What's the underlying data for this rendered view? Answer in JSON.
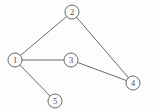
{
  "diagram": {
    "type": "node-link-graph",
    "canvas": {
      "width": 153,
      "height": 112,
      "background": "#fdfdfc"
    },
    "style": {
      "stroke_color": "#5a5a5a",
      "node_fill": "#fdfdfc",
      "label_color": "#4a4a4a",
      "node_radius": 7,
      "stroke_width": 0.9
    },
    "nodes": [
      {
        "id": "1",
        "label": "1",
        "x": 15,
        "y": 60,
        "r": 7
      },
      {
        "id": "2",
        "label": "2",
        "x": 72,
        "y": 12,
        "r": 7
      },
      {
        "id": "3",
        "label": "3",
        "x": 71,
        "y": 60,
        "r": 7
      },
      {
        "id": "4",
        "label": "4",
        "x": 133,
        "y": 83,
        "r": 7
      },
      {
        "id": "5",
        "label": "5",
        "x": 55,
        "y": 101,
        "r": 7
      }
    ],
    "edges": [
      {
        "id": "edge-1-2",
        "from": "1",
        "to": "2"
      },
      {
        "id": "edge-2-4",
        "from": "2",
        "to": "4"
      },
      {
        "id": "edge-1-3",
        "from": "1",
        "to": "3"
      },
      {
        "id": "edge-3-4",
        "from": "3",
        "to": "4"
      },
      {
        "id": "edge-1-5",
        "from": "1",
        "to": "5"
      }
    ]
  }
}
